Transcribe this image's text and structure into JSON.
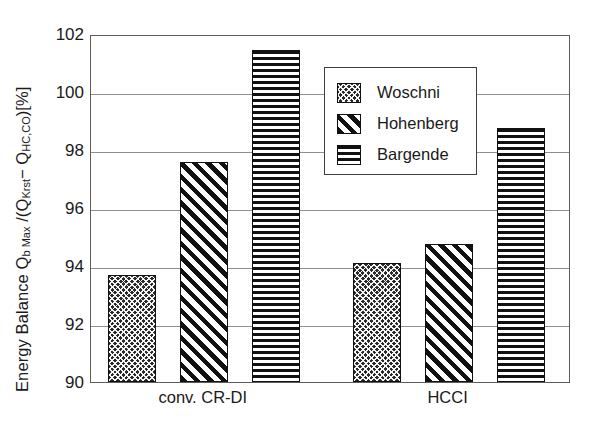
{
  "chart_data": {
    "type": "bar",
    "title": "",
    "xlabel": "",
    "ylabel": "Energy Balance Q_b Max /(Q_Krst - Q_HC,CO) [%]",
    "ylabel_parts": {
      "main1": "Energy Balance Q",
      "sub1": "b Max",
      "main2": " /(Q",
      "sub2": "Krst",
      "main3": "− Q",
      "sub3": "HC,CO",
      "main4": ")[%]"
    },
    "categories": [
      "conv. CR-DI",
      "HCCI"
    ],
    "ylim": [
      90,
      102
    ],
    "yticks": [
      102,
      100,
      98,
      96,
      94,
      92,
      90
    ],
    "ytick_labels": [
      "102",
      "100",
      "98",
      "96",
      "94",
      "92",
      "90"
    ],
    "grid": true,
    "grid_axis": "y",
    "legend_position": "upper center",
    "series": [
      {
        "name": "Woschni",
        "pattern": "crosshatch-dark",
        "values": [
          93.7,
          94.1
        ]
      },
      {
        "name": "Hohenberg",
        "pattern": "diagonal-hatch",
        "values": [
          97.6,
          94.75
        ]
      },
      {
        "name": "Bargende",
        "pattern": "horizontal-lines",
        "values": [
          101.45,
          98.75
        ]
      }
    ],
    "colors": {
      "background": "#ffffff",
      "axis": "#5c5c5c",
      "grid": "#8e8e8e",
      "bar_outline": "#111111",
      "text": "#1a1a1a"
    }
  }
}
